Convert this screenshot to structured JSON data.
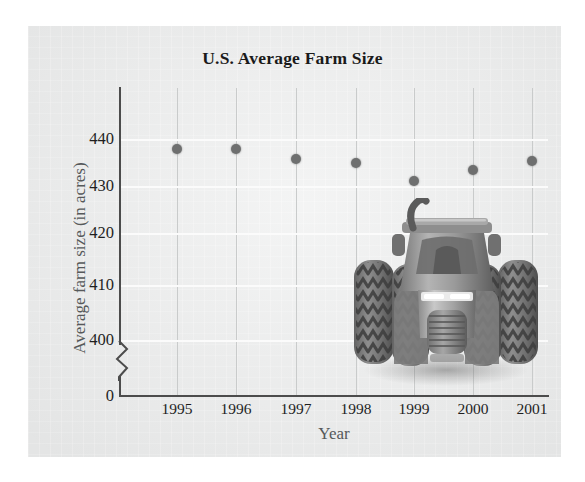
{
  "figure": {
    "title": "U.S. Average Farm Size",
    "illustration_name": "tractor-front-view"
  },
  "chart_data": {
    "type": "scatter",
    "title": "U.S. Average Farm Size",
    "xlabel": "Year",
    "ylabel": "Average farm size (in acres)",
    "categories": [
      "1995",
      "1996",
      "1997",
      "1998",
      "1999",
      "2000",
      "2001"
    ],
    "values": [
      438,
      438,
      436,
      435,
      432,
      433,
      435
    ],
    "x": [
      1995,
      1996,
      1997,
      1998,
      1999,
      2000,
      2001
    ],
    "ylim": [
      395,
      445
    ],
    "yticks": [
      "440",
      "430",
      "420",
      "410",
      "400",
      "0"
    ],
    "ytick_values": [
      440,
      430,
      420,
      410,
      400,
      0
    ],
    "xticks": [
      "1995",
      "1996",
      "1997",
      "1998",
      "1999",
      "2000",
      "2001"
    ],
    "axis_break": true,
    "axis_break_note": "y-axis broken between 0 and 400",
    "grid": true,
    "legend": "none",
    "marker_color": "#6e6f6f",
    "gridline_color": "#c9cbcb",
    "axis_color": "#4c4c4c",
    "panel_color": "#eceded"
  },
  "points": [
    {
      "year": "1995",
      "value": "438",
      "cx": 57,
      "cy": 61
    },
    {
      "year": "1996",
      "value": "438",
      "cx": 116,
      "cy": 61
    },
    {
      "year": "1997",
      "value": "436",
      "cx": 176,
      "cy": 71
    },
    {
      "year": "1998",
      "value": "435",
      "cx": 236,
      "cy": 75
    },
    {
      "year": "1999",
      "value": "432",
      "cx": 294,
      "cy": 93
    },
    {
      "year": "2000",
      "value": "433",
      "cx": 353,
      "cy": 82
    },
    {
      "year": "2001",
      "value": "435",
      "cx": 412,
      "cy": 73
    }
  ],
  "ygrid": [
    {
      "label": "440",
      "y": 51
    },
    {
      "label": "430",
      "y": 98
    },
    {
      "label": "420",
      "y": 145
    },
    {
      "label": "410",
      "y": 197
    },
    {
      "label": "400",
      "y": 252
    }
  ],
  "yticks": [
    {
      "label": "440",
      "top": 139
    },
    {
      "label": "430",
      "top": 186
    },
    {
      "label": "420",
      "top": 233
    },
    {
      "label": "410",
      "top": 285
    },
    {
      "label": "400",
      "top": 340
    },
    {
      "label": "0",
      "top": 396
    }
  ],
  "xticks": [
    {
      "label": "1995",
      "x": 177
    },
    {
      "label": "1996",
      "x": 236
    },
    {
      "label": "1997",
      "x": 296
    },
    {
      "label": "1998",
      "x": 356
    },
    {
      "label": "1999",
      "x": 414
    },
    {
      "label": "2000",
      "x": 473
    },
    {
      "label": "2001",
      "x": 532
    }
  ],
  "vgrid_x": [
    57,
    116,
    176,
    236,
    294,
    353,
    412
  ]
}
